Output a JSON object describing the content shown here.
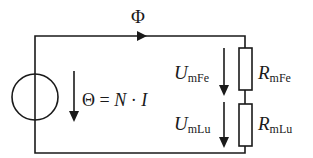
{
  "diagram": {
    "flux_label": "Φ",
    "source": {
      "type": "magnetomotive-force-source",
      "formula_parts": {
        "theta": "Θ",
        "equals": " = ",
        "n": "N",
        "dot": " · ",
        "i": "I"
      }
    },
    "elements": [
      {
        "id": "iron",
        "voltage_symbol": "U",
        "voltage_subscript": "mFe",
        "resistor_symbol": "R",
        "resistor_subscript": "mFe"
      },
      {
        "id": "air-gap",
        "voltage_symbol": "U",
        "voltage_subscript": "mLu",
        "resistor_symbol": "R",
        "resistor_subscript": "mLu"
      }
    ],
    "colors": {
      "line": "#1a1a1a",
      "background": "#ffffff"
    }
  }
}
